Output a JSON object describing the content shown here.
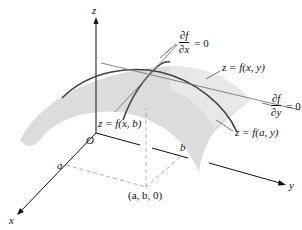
{
  "figure": {
    "axes": {
      "z_label": "z",
      "x_label": "x",
      "y_label": "y",
      "origin_label": "O",
      "a_label": "a",
      "b_label": "b",
      "point_label": "(a, b, 0)"
    },
    "labels": {
      "surface": "z = f(x, y)",
      "curve_xb": "z = f(x, b)",
      "curve_ay": "z = f(a, y)",
      "partial_x": {
        "num": "∂f",
        "den": "∂x",
        "rhs": "= 0"
      },
      "partial_y": {
        "num": "∂f",
        "den": "∂y",
        "rhs": "= 0"
      }
    },
    "colors": {
      "surface": "#d9d9d9",
      "curves": "#444444",
      "tangents": "#777777",
      "axes": "#111111",
      "dashed": "#9a9a9a"
    }
  }
}
